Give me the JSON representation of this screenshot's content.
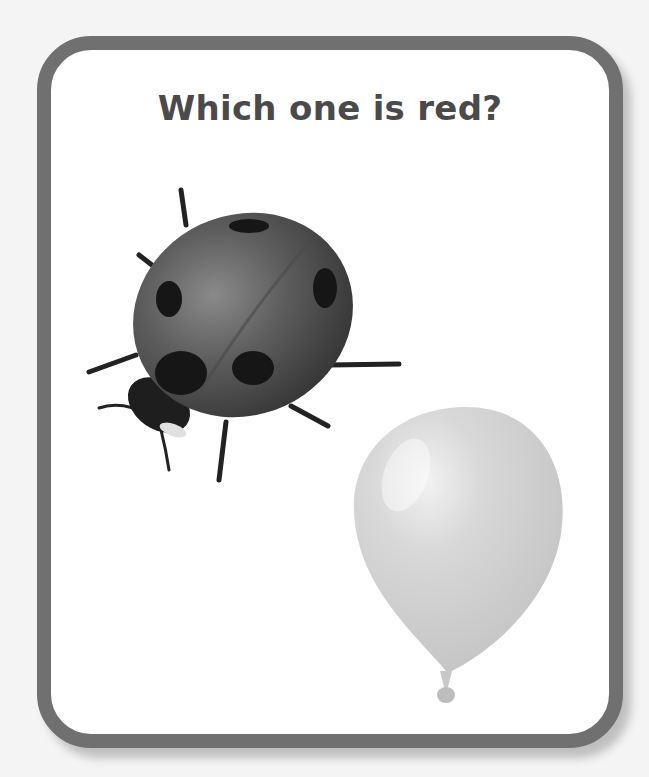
{
  "page": {
    "question": "Which one is red?",
    "colors": {
      "background": "#f4f4f4",
      "card_border": "#707070",
      "card_fill": "#ffffff",
      "title_text": "#4a4a4a"
    }
  },
  "choices": [
    {
      "id": "ladybug",
      "label": "ladybug",
      "icon": "ladybug-icon"
    },
    {
      "id": "balloon",
      "label": "balloon",
      "icon": "balloon-icon"
    }
  ]
}
